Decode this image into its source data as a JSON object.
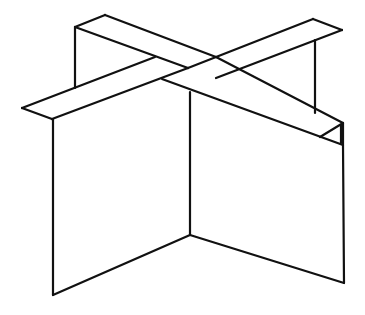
{
  "figure": {
    "description": "Line drawing of a 3D cross-shaped figure: two flat slats crossing in an X on top of two intersecting vertical panels",
    "colors": {
      "background": "#ffffff",
      "stroke": "#111111"
    },
    "stroke_width": 2.2,
    "segments": [
      {
        "name": "back-left-post",
        "points": [
          [
            75,
            27
          ],
          [
            75,
            88
          ]
        ]
      },
      {
        "name": "beam-a-top-edge-back",
        "points": [
          [
            75,
            27
          ],
          [
            105,
            15
          ]
        ]
      },
      {
        "name": "beam-a-upper-edge",
        "points": [
          [
            105,
            15
          ],
          [
            216,
            57
          ]
        ]
      },
      {
        "name": "beam-a-lower-edge-back",
        "points": [
          [
            75,
            27
          ],
          [
            188,
            68
          ]
        ]
      },
      {
        "name": "beam-a-upper-edge-front",
        "points": [
          [
            216,
            57
          ],
          [
            343,
            123
          ]
        ]
      },
      {
        "name": "beam-a-lower-edge-front",
        "points": [
          [
            162,
            79
          ],
          [
            343,
            145
          ]
        ]
      },
      {
        "name": "beam-a-end-outer",
        "points": [
          [
            343,
            123
          ],
          [
            343,
            145
          ]
        ]
      },
      {
        "name": "beam-a-end-inner",
        "points": [
          [
            320,
            137
          ],
          [
            343,
            123
          ]
        ]
      },
      {
        "name": "beam-a-end-thick",
        "points": [
          [
            341,
            125
          ],
          [
            341,
            143
          ]
        ]
      },
      {
        "name": "beam-b-upper-edge-back",
        "points": [
          [
            188,
            68
          ],
          [
            313,
            19
          ]
        ]
      },
      {
        "name": "beam-b-top-end",
        "points": [
          [
            313,
            19
          ],
          [
            342,
            30
          ]
        ]
      },
      {
        "name": "beam-b-lower-edge-back",
        "points": [
          [
            216,
            78
          ],
          [
            342,
            30
          ]
        ]
      },
      {
        "name": "beam-b-upper-edge-front",
        "points": [
          [
            22,
            108
          ],
          [
            155,
            57
          ]
        ]
      },
      {
        "name": "beam-b-left-tip-lower",
        "points": [
          [
            22,
            108
          ],
          [
            52,
            119
          ]
        ]
      },
      {
        "name": "beam-b-lower-edge-front",
        "points": [
          [
            52,
            119
          ],
          [
            188,
            68
          ]
        ]
      },
      {
        "name": "back-right-post",
        "points": [
          [
            315,
            40
          ],
          [
            315,
            113
          ]
        ]
      },
      {
        "name": "front-left-post",
        "points": [
          [
            53,
            119
          ],
          [
            53,
            295
          ]
        ]
      },
      {
        "name": "center-post",
        "points": [
          [
            190,
            92
          ],
          [
            190,
            235
          ]
        ]
      },
      {
        "name": "front-right-post",
        "points": [
          [
            343,
            145
          ],
          [
            344,
            283
          ]
        ]
      },
      {
        "name": "base-left",
        "points": [
          [
            53,
            295
          ],
          [
            190,
            235
          ]
        ]
      },
      {
        "name": "base-right",
        "points": [
          [
            190,
            235
          ],
          [
            344,
            283
          ]
        ]
      }
    ]
  }
}
